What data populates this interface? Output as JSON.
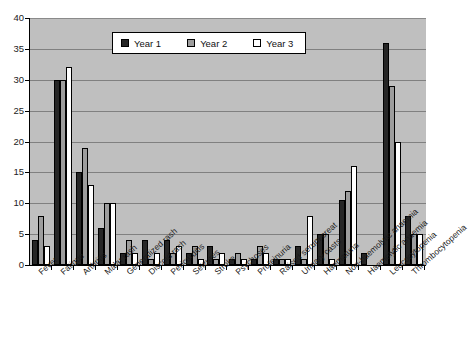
{
  "chart_data": {
    "type": "bar",
    "title": "",
    "xlabel": "",
    "ylabel": "",
    "ylim": [
      0,
      40
    ],
    "ytick_step": 5,
    "yticks": [
      0,
      5,
      10,
      15,
      20,
      25,
      30,
      35,
      40
    ],
    "grid": true,
    "legend_position": "top-center",
    "plot_background": "#bfbfbf",
    "categories": [
      "Fever",
      "Fatigue",
      "Arthritis",
      "Malar rash",
      "Generalized rash",
      "Discoid rash",
      "Pericarditis",
      "Seizures",
      "Stroke",
      "Psychoses",
      "Proteinuria",
      "Raised serum creat",
      "Urinary casts",
      "Haematuria",
      "Non-haemolytic anaemia",
      "Haemolytic anaemia",
      "Leucocytopenia",
      "Thrombocytopenia"
    ],
    "series": [
      {
        "name": "Year 1",
        "color": "#262626",
        "values": [
          4,
          30,
          15,
          6,
          2,
          4,
          4,
          2,
          3,
          1,
          1,
          1,
          3,
          5,
          10.5,
          2,
          36,
          8
        ]
      },
      {
        "name": "Year 2",
        "color": "#9d9d9d",
        "values": [
          8,
          30,
          19,
          10,
          4,
          1,
          2,
          3,
          1,
          2,
          3,
          1,
          1,
          5,
          12,
          0,
          29,
          5
        ]
      },
      {
        "name": "Year 3",
        "color": "#ffffff",
        "values": [
          3,
          32,
          13,
          10,
          2,
          2,
          3,
          1,
          2,
          1,
          2,
          1,
          8,
          1,
          16,
          0,
          20,
          5
        ]
      }
    ]
  },
  "legend": {
    "items": [
      {
        "label": "Year 1",
        "swatch": "year1-swatch"
      },
      {
        "label": "Year 2",
        "swatch": "year2-swatch"
      },
      {
        "label": "Year 3",
        "swatch": "year3-swatch"
      }
    ]
  }
}
